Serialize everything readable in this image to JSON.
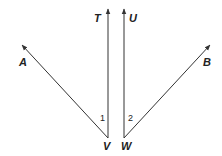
{
  "diagram": {
    "type": "geometry-rays",
    "colors": {
      "stroke": "#333333",
      "text": "#222222",
      "background": "#ffffff"
    },
    "vertices": {
      "V": {
        "label": "V",
        "x": 108,
        "y": 138
      },
      "W": {
        "label": "W",
        "x": 124,
        "y": 138
      }
    },
    "rays": [
      {
        "id": "VT",
        "from": "V",
        "toward": "T",
        "tip": {
          "x": 108,
          "y": 8
        }
      },
      {
        "id": "VA",
        "from": "V",
        "toward": "A",
        "tip": {
          "x": 21,
          "y": 44
        }
      },
      {
        "id": "WU",
        "from": "W",
        "toward": "U",
        "tip": {
          "x": 124,
          "y": 8
        }
      },
      {
        "id": "WB",
        "from": "W",
        "toward": "B",
        "tip": {
          "x": 211,
          "y": 44
        }
      }
    ],
    "point_labels": {
      "T": "T",
      "U": "U",
      "A": "A",
      "B": "B",
      "V": "V",
      "W": "W"
    },
    "angle_labels": {
      "angle1": "1",
      "angle2": "2"
    }
  }
}
